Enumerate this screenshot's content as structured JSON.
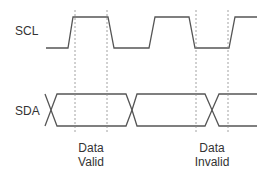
{
  "diagram": {
    "signals": [
      {
        "name": "SCL",
        "label": "SCL"
      },
      {
        "name": "SDA",
        "label": "SDA"
      }
    ],
    "annotations": [
      {
        "line1": "Data",
        "line2": "Valid"
      },
      {
        "line1": "Data",
        "line2": "Invalid"
      }
    ],
    "colors": {
      "stroke": "#555555",
      "guide": "#8a8a8a",
      "text": "#333333",
      "background": "#ffffff"
    }
  }
}
